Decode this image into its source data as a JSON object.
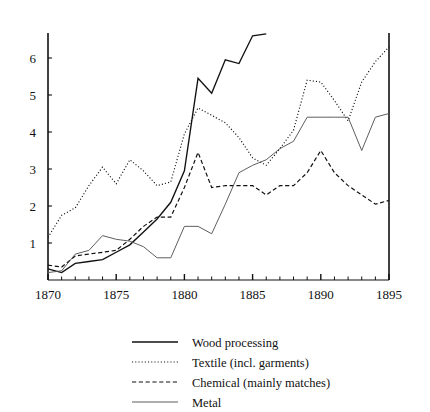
{
  "chart_data": {
    "type": "line",
    "title": "",
    "subtitle": "",
    "xlabel": "",
    "ylabel": "",
    "xlim": [
      1870,
      1895
    ],
    "ylim": [
      0,
      6.7
    ],
    "grid": false,
    "legend_position": "bottom",
    "xticks": [
      1870,
      1875,
      1880,
      1885,
      1890,
      1895
    ],
    "xtick_labels": [
      "1870",
      "1875",
      "1880",
      "1885",
      "1890",
      "1895"
    ],
    "x_minor_tick_step": 1,
    "yticks": [
      1,
      2,
      3,
      4,
      5,
      6
    ],
    "ytick_labels": [
      "1",
      "2",
      "3",
      "4",
      "5",
      "6"
    ],
    "axis_color": "#111111",
    "series": [
      {
        "name": "Wood processing",
        "style": "solid",
        "color": "#111111",
        "x": [
          1870,
          1871,
          1872,
          1873,
          1874,
          1875,
          1876,
          1877,
          1878,
          1879,
          1880,
          1881,
          1882,
          1883,
          1884,
          1885,
          1886
        ],
        "values": [
          0.3,
          0.2,
          0.45,
          0.5,
          0.55,
          0.75,
          0.95,
          1.3,
          1.65,
          2.1,
          2.95,
          5.45,
          5.05,
          5.95,
          5.85,
          6.6,
          6.65
        ]
      },
      {
        "name": "Textile (incl. garments)",
        "style": "dotted",
        "color": "#111111",
        "x": [
          1870,
          1871,
          1872,
          1873,
          1874,
          1875,
          1876,
          1877,
          1878,
          1879,
          1880,
          1881,
          1882,
          1883,
          1884,
          1885,
          1886,
          1887,
          1888,
          1889,
          1890,
          1891,
          1892,
          1893,
          1894,
          1895
        ],
        "values": [
          1.15,
          1.75,
          1.95,
          2.55,
          3.05,
          2.6,
          3.25,
          2.95,
          2.55,
          2.65,
          3.95,
          4.65,
          4.45,
          4.25,
          3.85,
          3.3,
          3.1,
          3.55,
          4.05,
          5.4,
          5.35,
          4.85,
          4.3,
          5.35,
          5.9,
          6.3
        ]
      },
      {
        "name": "Chemical (mainly matches)",
        "style": "dashed",
        "color": "#111111",
        "x": [
          1870,
          1871,
          1872,
          1873,
          1874,
          1875,
          1876,
          1877,
          1878,
          1879,
          1880,
          1881,
          1882,
          1883,
          1884,
          1885,
          1886,
          1887,
          1888,
          1889,
          1890,
          1891,
          1892,
          1893,
          1894,
          1895
        ],
        "values": [
          0.4,
          0.35,
          0.65,
          0.7,
          0.75,
          0.8,
          1.1,
          1.45,
          1.7,
          1.7,
          2.5,
          3.45,
          2.5,
          2.55,
          2.55,
          2.55,
          2.3,
          2.55,
          2.55,
          2.9,
          3.5,
          2.9,
          2.55,
          2.3,
          2.05,
          2.15
        ]
      },
      {
        "name": "Metal",
        "style": "solid-thin",
        "color": "#555555",
        "x": [
          1870,
          1871,
          1872,
          1873,
          1874,
          1875,
          1876,
          1877,
          1878,
          1879,
          1880,
          1881,
          1882,
          1883,
          1884,
          1885,
          1886,
          1887,
          1888,
          1889,
          1890,
          1891,
          1892,
          1893,
          1894,
          1895
        ],
        "values": [
          0.2,
          0.25,
          0.7,
          0.8,
          1.2,
          1.1,
          1.05,
          0.9,
          0.6,
          0.6,
          1.45,
          1.45,
          1.25,
          2.05,
          2.9,
          3.1,
          3.25,
          3.55,
          3.75,
          4.4,
          4.4,
          4.4,
          4.4,
          3.5,
          4.4,
          4.5
        ]
      }
    ]
  },
  "legend": {
    "items": [
      {
        "label": "Wood processing",
        "style": "solid"
      },
      {
        "label": "Textile (incl. garments)",
        "style": "dotted"
      },
      {
        "label": "Chemical (mainly matches)",
        "style": "dashed"
      },
      {
        "label": "Metal",
        "style": "solid-thin"
      }
    ]
  }
}
